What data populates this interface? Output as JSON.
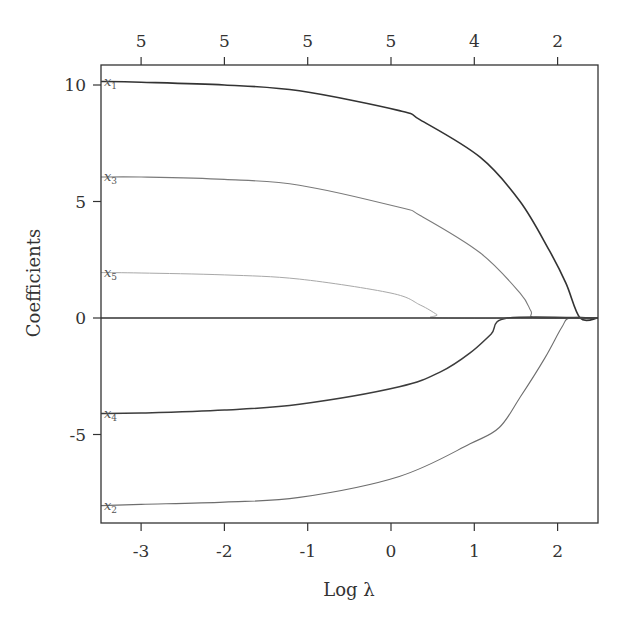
{
  "chart_data": {
    "type": "line",
    "title": "",
    "xlabel": "Log λ",
    "ylabel": "Coefficients",
    "xlim": [
      -3.48,
      2.48
    ],
    "ylim": [
      -8.8,
      10.86
    ],
    "grid": false,
    "legend": "none (inline labels at left end of each line)",
    "x_ticks": [
      -3,
      -2,
      -1,
      0,
      1,
      2
    ],
    "x_tick_labels": [
      "-3",
      "-2",
      "-1",
      "0",
      "1",
      "2"
    ],
    "y_ticks": [
      10,
      5,
      0,
      -5
    ],
    "y_tick_labels": [
      "10",
      "5",
      "0",
      "-5"
    ],
    "top_axis": {
      "description": "number of nonzero coefficients",
      "ticks": [
        -3,
        -2,
        -1,
        0,
        1,
        2
      ],
      "labels": [
        "5",
        "5",
        "5",
        "5",
        "4",
        "2"
      ]
    },
    "reference_line": {
      "y": 0
    },
    "series": [
      {
        "name": "x1",
        "label_main": "x",
        "label_sub": "1",
        "color": "#333333",
        "width": 1.6,
        "x": [
          -3.48,
          -3.0,
          -2.0,
          -1.1,
          0.1,
          0.35,
          1.07,
          1.55,
          1.9,
          2.1,
          2.27,
          2.48
        ],
        "values": [
          10.15,
          10.12,
          10.0,
          9.75,
          8.9,
          8.5,
          6.9,
          5.0,
          2.9,
          1.5,
          0,
          0
        ]
      },
      {
        "name": "x2",
        "label_main": "x",
        "label_sub": "2",
        "color": "#6e6e6e",
        "width": 1.1,
        "x": [
          -3.48,
          -3.0,
          -2.0,
          -1.1,
          0.1,
          0.95,
          1.3,
          1.55,
          1.85,
          2.05,
          2.15,
          2.48
        ],
        "values": [
          -8.05,
          -8.0,
          -7.9,
          -7.7,
          -6.8,
          -5.4,
          -4.7,
          -3.4,
          -1.7,
          -0.4,
          0,
          0
        ]
      },
      {
        "name": "x3",
        "label_main": "x",
        "label_sub": "3",
        "color": "#7a7a7a",
        "width": 1.1,
        "x": [
          -3.48,
          -3.0,
          -2.0,
          -1.1,
          0.1,
          0.35,
          1.07,
          1.55,
          1.68,
          1.75,
          2.48
        ],
        "values": [
          6.05,
          6.05,
          5.95,
          5.7,
          4.75,
          4.4,
          2.8,
          1.07,
          0.3,
          0,
          0
        ]
      },
      {
        "name": "x4",
        "label_main": "x",
        "label_sub": "4",
        "color": "#3c3c3c",
        "width": 1.5,
        "x": [
          -3.48,
          -3.0,
          -2.0,
          -1.1,
          0.1,
          0.6,
          0.95,
          1.2,
          1.4,
          2.48
        ],
        "values": [
          -4.1,
          -4.08,
          -3.95,
          -3.7,
          -2.95,
          -2.3,
          -1.5,
          -0.7,
          0,
          0
        ]
      },
      {
        "name": "x5",
        "label_main": "x",
        "label_sub": "5",
        "color": "#a8a8a8",
        "width": 1.0,
        "x": [
          -3.48,
          -3.0,
          -2.0,
          -1.1,
          0.0,
          0.35,
          0.55,
          0.62,
          2.48
        ],
        "values": [
          1.95,
          1.93,
          1.85,
          1.67,
          1.07,
          0.56,
          0.15,
          0,
          0
        ]
      }
    ]
  }
}
